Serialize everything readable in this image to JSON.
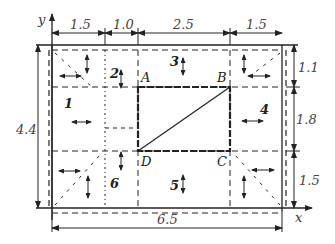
{
  "axes": {
    "x_label": "x",
    "y_label": "y"
  },
  "dimensions": {
    "top": [
      "1.5",
      "1.0",
      "2.5",
      "1.5"
    ],
    "right": [
      "1.1",
      "1.8",
      "1.5"
    ],
    "left": "4.4",
    "bottom": "6.5"
  },
  "points": {
    "A": "A",
    "B": "B",
    "C": "C",
    "D": "D"
  },
  "regions": [
    "1",
    "2",
    "3",
    "4",
    "5",
    "6"
  ],
  "colors": {
    "line": "#222222",
    "text": "#333333",
    "background": "#ffffff"
  }
}
